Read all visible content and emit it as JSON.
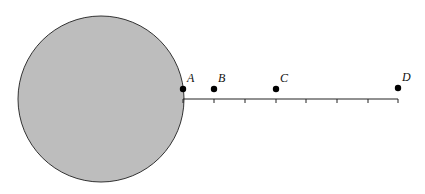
{
  "diagram": {
    "type": "geometry",
    "circle": {
      "cx": 101,
      "cy": 99,
      "r": 83,
      "fill": "#bdbdbd",
      "stroke": "#333333"
    },
    "line": {
      "x1": 183,
      "y1": 99,
      "x2": 398,
      "y2": 99,
      "stroke": "#222222"
    },
    "ticks": [
      183,
      214,
      245,
      276,
      306,
      337,
      368,
      398
    ],
    "points": [
      {
        "label": "A",
        "x": 183,
        "y": 89
      },
      {
        "label": "B",
        "x": 214,
        "y": 89
      },
      {
        "label": "C",
        "x": 276,
        "y": 89
      },
      {
        "label": "D",
        "x": 398,
        "y": 88
      }
    ]
  }
}
